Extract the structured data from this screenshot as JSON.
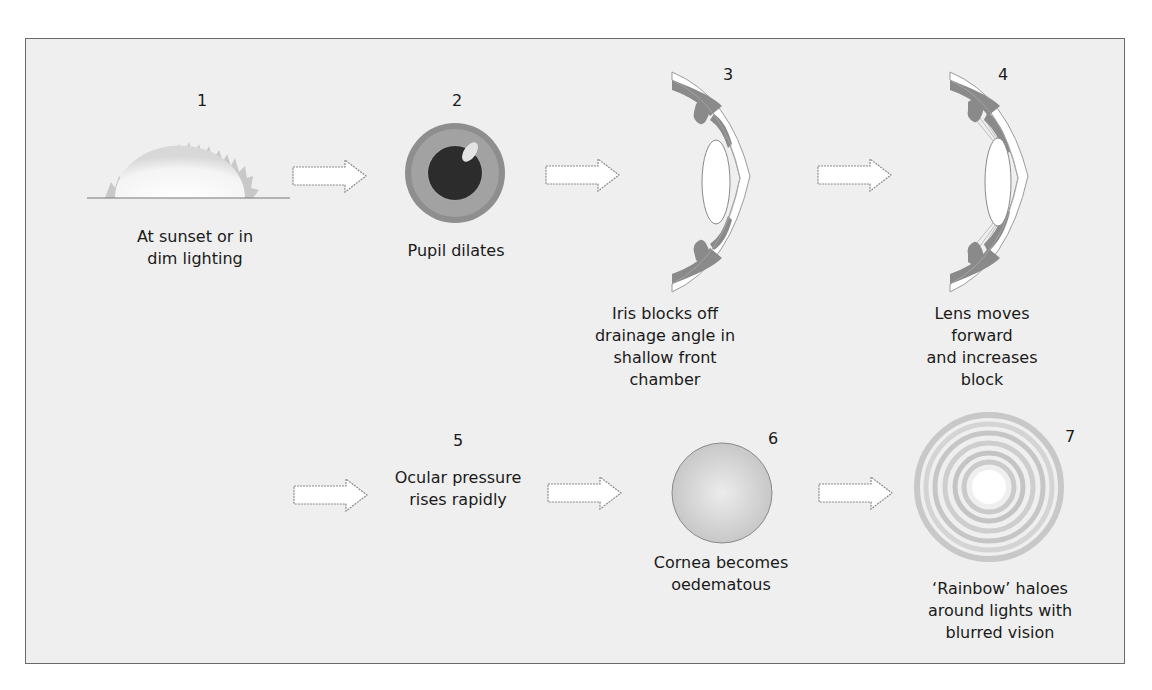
{
  "diagram": {
    "title": "",
    "steps": [
      {
        "number": "1",
        "caption": "At sunset or in\ndim lighting",
        "icon": "sunset-icon"
      },
      {
        "number": "2",
        "caption": "Pupil dilates",
        "icon": "dilated-pupil-icon"
      },
      {
        "number": "3",
        "caption": "Iris blocks off\ndrainage angle in\nshallow front\nchamber",
        "icon": "eye-cross-section-icon"
      },
      {
        "number": "4",
        "caption": "Lens moves\nforward\nand increases\nblock",
        "icon": "eye-cross-section-lens-forward-icon"
      },
      {
        "number": "5",
        "caption": "Ocular pressure\nrises rapidly",
        "icon": ""
      },
      {
        "number": "6",
        "caption": "Cornea becomes\noedematous",
        "icon": "oedematous-cornea-icon"
      },
      {
        "number": "7",
        "caption": "‘Rainbow’ haloes\naround lights with\nblurred vision",
        "icon": "halo-rings-icon"
      }
    ],
    "colors": {
      "background": "#efefef",
      "border": "#6a6a6a",
      "iris": "#8c8c8c",
      "pupil": "#2a2a2a",
      "tissue": "#8a8a8a",
      "arrow_fill": "#ffffff",
      "arrow_stroke": "#9a9a9a"
    }
  }
}
